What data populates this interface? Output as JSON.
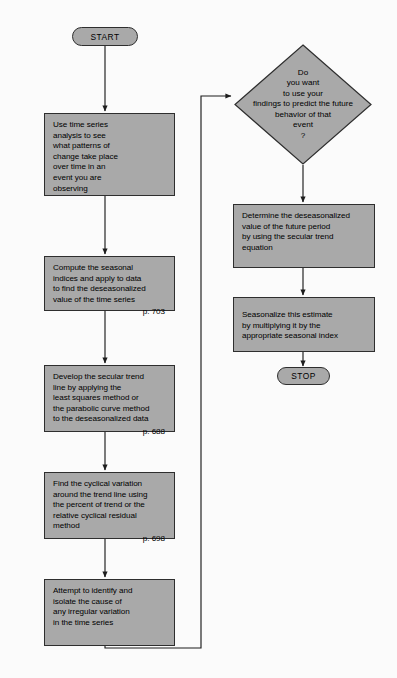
{
  "diagram": {
    "type": "flowchart",
    "colors": {
      "node_fill": "#a9a9a9",
      "node_border": "#2e2e2e",
      "connector": "#1d1d1d",
      "background": "#fbfbfb"
    },
    "start_terminator": {
      "label": "START"
    },
    "stop_terminator": {
      "label": "STOP"
    },
    "left_column": [
      {
        "id": "use-time-series",
        "lines": [
          "Use time series",
          "analysis to see",
          "what patterns of",
          "change take place",
          "over time in an",
          "event you are",
          "observing"
        ],
        "page_ref": ""
      },
      {
        "id": "compute-seasonal-indices",
        "lines": [
          "Compute the seasonal",
          "indices and apply to data",
          "to find the deseasonalized",
          "value of the time series"
        ],
        "page_ref": "p. 703"
      },
      {
        "id": "develop-secular-trend",
        "lines": [
          "Develop the secular trend",
          "line by applying the",
          "least squares method or",
          "the parabolic curve method",
          "to the deseasonalized data"
        ],
        "page_ref": "p. 688"
      },
      {
        "id": "find-cyclical-variation",
        "lines": [
          "Find the cyclical variation",
          "around the trend line using",
          "the percent of trend or the",
          "relative cyclical residual",
          "method"
        ],
        "page_ref": "p. 698"
      },
      {
        "id": "identify-irregular-variation",
        "lines": [
          "Attempt to identify and",
          "isolate the cause of",
          "any irregular variation",
          "in the time series"
        ],
        "page_ref": ""
      }
    ],
    "decision": {
      "id": "predict-future-behavior",
      "lines": [
        "Do",
        "you want",
        "to use your",
        "findings to predict the future",
        "behavior of that",
        "event",
        "?"
      ]
    },
    "right_column": [
      {
        "id": "determine-deseasonalized-future",
        "lines": [
          "Determine the deseasonalized",
          "value of the future period",
          "by using the secular trend",
          "equation"
        ],
        "page_ref": ""
      },
      {
        "id": "seasonalize-estimate",
        "lines": [
          "Seasonalize this estimate",
          "by multiplying it by the",
          "appropriate seasonal index"
        ],
        "page_ref": ""
      }
    ]
  }
}
